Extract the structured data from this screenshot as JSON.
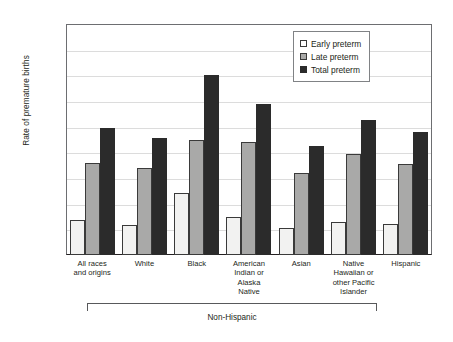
{
  "chart_data": {
    "type": "bar",
    "title": "",
    "xlabel": "",
    "ylabel": "Rate of premature births",
    "ylim": [
      0,
      18
    ],
    "ytick_labels": [
      "18%",
      "16%",
      "14%",
      "12%",
      "10%",
      "8%",
      "6%",
      "4%",
      "2%",
      "0%"
    ],
    "ytick_values": [
      18,
      16,
      14,
      12,
      10,
      8,
      6,
      4,
      2,
      0
    ],
    "grid": true,
    "legend_position": "top-right",
    "categories": [
      "All races and origins",
      "White",
      "Black",
      "American Indian or Alaska Native",
      "Asian",
      "Native Hawaiian or other Pacific Islander",
      "Hispanic"
    ],
    "category_lines": [
      [
        "All races",
        "and origins"
      ],
      [
        "White"
      ],
      [
        "Black"
      ],
      [
        "American",
        "Indian or",
        "Alaska",
        "Native"
      ],
      [
        "Asian"
      ],
      [
        "Native",
        "Hawaiian or",
        "other Pacific",
        "Islander"
      ],
      [
        "Hispanic"
      ]
    ],
    "series": [
      {
        "name": "Early preterm",
        "color": "#f2f2f1",
        "values": [
          2.7,
          2.3,
          4.8,
          3.0,
          2.1,
          2.6,
          2.4
        ]
      },
      {
        "name": "Late preterm",
        "color": "#a9a9a8",
        "values": [
          7.2,
          6.8,
          9.0,
          8.8,
          6.4,
          7.9,
          7.1
        ]
      },
      {
        "name": "Total preterm",
        "color": "#2b2b2b",
        "values": [
          9.9,
          9.1,
          14.0,
          11.8,
          8.5,
          10.5,
          9.6
        ]
      }
    ],
    "annotations": [
      {
        "text": "Non-Hispanic",
        "spans_categories": [
          "White",
          "Black",
          "American Indian or Alaska Native",
          "Asian",
          "Native Hawaiian or other Pacific Islander",
          "Hispanic"
        ]
      }
    ]
  },
  "legend": {
    "items": [
      {
        "label": "Early preterm",
        "icon": "square-outline-icon"
      },
      {
        "label": "Late preterm",
        "icon": "square-gray-icon"
      },
      {
        "label": "Total preterm",
        "icon": "square-black-icon"
      }
    ]
  }
}
